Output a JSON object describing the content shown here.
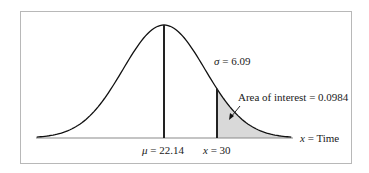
{
  "chart_data": {
    "type": "area",
    "title": "",
    "distribution": "normal",
    "mean": 22.14,
    "sigma": 6.09,
    "x_value": 30,
    "area_of_interest": 0.0984,
    "xlabel": "x = Time",
    "ylabel": "",
    "grid": false,
    "annotations": {
      "sigma": "σ = 6.09",
      "area": "Area of interest = 0.0984",
      "mean": "μ = 22.14",
      "x": "x = 30",
      "axis": "x = Time"
    },
    "shaded_region": "right tail, x > 30"
  },
  "labels": {
    "sigma_symbol": "σ",
    "sigma_value": " = 6.09",
    "area": "Area of interest = 0.0984",
    "mu_symbol": "μ",
    "mu_value": " = 22.14",
    "x30_symbol": "x",
    "x30_value": " = 30",
    "axis_symbol": "x",
    "axis_value": " = Time"
  }
}
